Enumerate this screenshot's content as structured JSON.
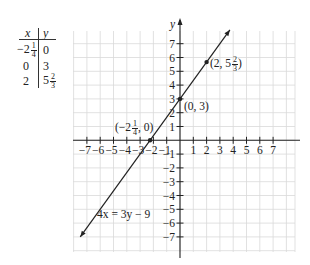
{
  "table": {
    "headers": [
      "x",
      "y"
    ],
    "rows": [
      {
        "x_whole": "−2",
        "x_num": "1",
        "x_den": "4",
        "y_whole": "0",
        "y_num": "",
        "y_den": ""
      },
      {
        "x_whole": "0",
        "x_num": "",
        "x_den": "",
        "y_whole": "3",
        "y_num": "",
        "y_den": ""
      },
      {
        "x_whole": "2",
        "x_num": "",
        "x_den": "",
        "y_whole": "5",
        "y_num": "2",
        "y_den": "3"
      }
    ]
  },
  "graph": {
    "x_axis_label": "x",
    "y_axis_label": "y",
    "x_ticks": [
      "−7",
      "−6",
      "−5",
      "−4",
      "−3",
      "−2",
      "−1",
      "1",
      "2",
      "3",
      "4",
      "5",
      "6",
      "7"
    ],
    "y_ticks": [
      "7",
      "6",
      "5",
      "4",
      "3",
      "2",
      "1",
      "−1",
      "−2",
      "−3",
      "−4",
      "−5",
      "−6",
      "−7"
    ],
    "equation_label": "4x = 3y − 9",
    "points": [
      {
        "label_pre": "(−2",
        "label_num": "1",
        "label_den": "4",
        "label_post": ", 0)",
        "x": -2.25,
        "y": 0
      },
      {
        "label_pre": "(0, 3)",
        "label_num": "",
        "label_den": "",
        "label_post": "",
        "x": 0,
        "y": 3
      },
      {
        "label_pre": "(2, 5",
        "label_num": "2",
        "label_den": "3",
        "label_post": ")",
        "x": 2,
        "y": 5.667
      }
    ],
    "line_color": "#222222",
    "grid_color": "#d9d9d9"
  },
  "chart_data": {
    "type": "line",
    "title": "",
    "equation": "4x = 3y − 9",
    "xlabel": "x",
    "ylabel": "y",
    "xlim": [
      -8,
      8.5
    ],
    "ylim": [
      -8,
      8
    ],
    "grid": true,
    "series": [
      {
        "name": "4x = 3y − 9",
        "x": [
          -7.5,
          -2.25,
          0,
          2,
          3.75
        ],
        "y": [
          -7,
          0,
          3,
          5.667,
          8
        ]
      }
    ],
    "marked_points": [
      {
        "label": "(−2 1/4, 0)",
        "x": -2.25,
        "y": 0
      },
      {
        "label": "(0, 3)",
        "x": 0,
        "y": 3
      },
      {
        "label": "(2, 5 2/3)",
        "x": 2,
        "y": 5.667
      }
    ],
    "table": {
      "x": [
        "−2 1/4",
        "0",
        "2"
      ],
      "y": [
        "0",
        "3",
        "5 2/3"
      ]
    }
  }
}
